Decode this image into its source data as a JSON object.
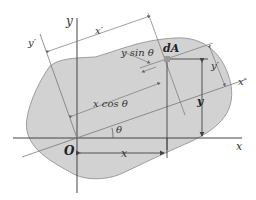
{
  "diagram": {
    "colors": {
      "region_fill": "#d2d2d2",
      "region_stroke": "#8a8a8a",
      "axis": "#444444",
      "construction": "#7a7a7a",
      "element": "#9a9a9a"
    },
    "labels": {
      "y_axis": "y",
      "x_axis": "x",
      "y_prime_top": "y′",
      "x_prime_top": "x′",
      "x_prime_right": "x′",
      "y_prime_right": "y′",
      "dA": "dA",
      "y_sin": "y sin θ",
      "x_cos": "x cos θ",
      "theta": "θ",
      "origin": "O",
      "x_dim": "x",
      "y_dim": "y"
    }
  }
}
